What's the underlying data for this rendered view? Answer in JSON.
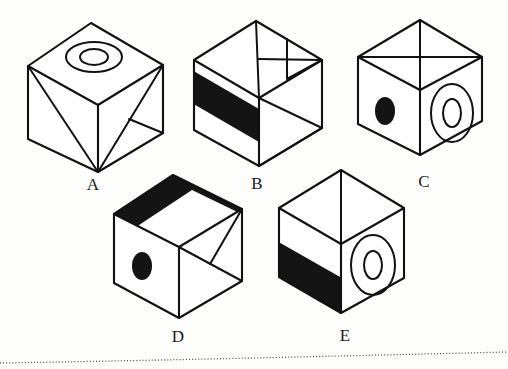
{
  "figure": {
    "background_color": "#fdfdfc",
    "ink_color": "#111111",
    "fill_color": "#141414",
    "width": 508,
    "height": 369
  },
  "cubes": [
    {
      "id": "A",
      "label": "A",
      "label_x": 93,
      "label_y": 190,
      "top_face": {
        "marks": [
          "concentric-ellipse-ring"
        ]
      },
      "left_face": {
        "marks": [
          "diagonal-line"
        ]
      },
      "right_face": {
        "marks": [
          "diagonal-line",
          "small-triangle"
        ]
      }
    },
    {
      "id": "B",
      "label": "B",
      "label_x": 257,
      "label_y": 189,
      "top_face": {
        "marks": [
          "median-line",
          "cross-line",
          "small-triangle"
        ]
      },
      "left_face": {
        "marks": [
          "black-horizontal-band"
        ]
      },
      "right_face": {
        "marks": [
          "triangle"
        ]
      }
    },
    {
      "id": "C",
      "label": "C",
      "label_x": 424,
      "label_y": 187,
      "top_face": {
        "marks": [
          "median-line",
          "cross-line"
        ]
      },
      "left_face": {
        "marks": [
          "solid-black-ellipse"
        ]
      },
      "right_face": {
        "marks": [
          "concentric-ellipse-ring"
        ]
      }
    },
    {
      "id": "D",
      "label": "D",
      "label_x": 178,
      "label_y": 342,
      "top_face": {
        "marks": [
          "black-band"
        ]
      },
      "left_face": {
        "marks": [
          "solid-black-ellipse"
        ]
      },
      "right_face": {
        "marks": [
          "diagonal-line",
          "triangle"
        ]
      }
    },
    {
      "id": "E",
      "label": "E",
      "label_x": 345,
      "label_y": 341,
      "top_face": {
        "marks": [
          "median-line"
        ]
      },
      "left_face": {
        "marks": [
          "black-lower-band"
        ]
      },
      "right_face": {
        "marks": [
          "concentric-ellipse-ring"
        ]
      }
    }
  ],
  "footer_rule": {
    "style": "dotted",
    "color": "#4a4a4a"
  }
}
